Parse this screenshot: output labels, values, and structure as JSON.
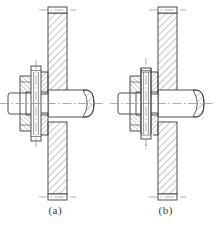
{
  "figure": {
    "title": "",
    "background_color": "#ffffff",
    "line_color": "#3c3c3c",
    "hatch_color": "#555555",
    "centerline_color": "#8a8a8a",
    "views": [
      {
        "id": "a",
        "caption": "(a)",
        "description": "Sectional view of bolted joint with vertical plate, horizontal stud, hex nut, washer and long split pin",
        "components": [
          "vertical-plate",
          "horizontal-stud",
          "hex-nut",
          "washer",
          "split-pin-long",
          "horizontal-centerline",
          "vertical-centerline"
        ]
      },
      {
        "id": "b",
        "caption": "(b)",
        "description": "Sectional view of bolted joint with vertical plate, horizontal stud, hex nut, washer and short split pin",
        "components": [
          "vertical-plate",
          "horizontal-stud",
          "hex-nut",
          "washer",
          "split-pin-short",
          "horizontal-centerline",
          "vertical-centerline"
        ]
      }
    ]
  }
}
